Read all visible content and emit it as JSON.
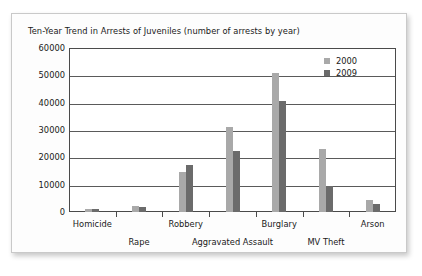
{
  "chart_data": {
    "type": "bar",
    "title": "Ten-Year Trend in Arrests of Juveniles (number of arrests by year)",
    "xlabel": "",
    "ylabel": "",
    "ylim": [
      0,
      60000
    ],
    "ytick_step": 10000,
    "yticks": [
      "60000",
      "50000",
      "40000",
      "30000",
      "20000",
      "10000",
      "0"
    ],
    "grid": true,
    "legend_position": "top-right",
    "categories": [
      "Homicide",
      "Rape",
      "Robbery",
      "Aggravated Assault",
      "Burglary",
      "MV Theft",
      "Arson"
    ],
    "series": [
      {
        "name": "2000",
        "color": "#a9a9a9",
        "values": [
          1000,
          2300,
          14500,
          31000,
          51000,
          23000,
          4500
        ]
      },
      {
        "name": "2009",
        "color": "#6b6b6b",
        "values": [
          1000,
          1800,
          17100,
          22400,
          40500,
          9500,
          2800
        ]
      }
    ]
  },
  "legend": {
    "items": [
      {
        "label": "2000",
        "color": "#a9a9a9"
      },
      {
        "label": "2009",
        "color": "#6b6b6b"
      }
    ]
  }
}
